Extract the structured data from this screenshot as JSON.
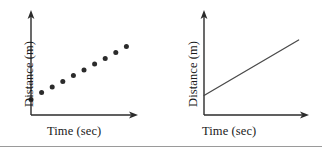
{
  "figure": {
    "background_color": "#ffffff",
    "ink_color": "#2b2b2b",
    "rule_color": "#9a9a9a"
  },
  "panels": [
    {
      "id": "left",
      "name": "scatter-plot-panel",
      "xlabel": "Time (sec)",
      "ylabel": "Distance (m)",
      "axis": {
        "origin_x": 31,
        "origin_y": 115,
        "y_top": 12,
        "x_right": 137,
        "arrowheads": [
          "y-top",
          "x-right"
        ]
      }
    },
    {
      "id": "right",
      "name": "line-plot-panel",
      "xlabel": "Time (sec)",
      "ylabel": "Distance (m)",
      "axis": {
        "origin_x": 43,
        "origin_y": 115,
        "y_top": 12,
        "x_right": 147,
        "arrowheads": [
          "y-top",
          "x-right"
        ]
      }
    }
  ],
  "chart_data": [
    {
      "type": "scatter",
      "title": "",
      "xlabel": "Time (sec)",
      "ylabel": "Distance (m)",
      "xlim": [
        0,
        10
      ],
      "ylim": [
        0,
        10
      ],
      "grid": false,
      "legend": "none",
      "marker": {
        "shape": "circle",
        "color": "#2b2b2b",
        "size_px": 5
      },
      "x": [
        0,
        1,
        2,
        3,
        4,
        5,
        6,
        7,
        8,
        9
      ],
      "y": [
        1.55,
        2.25,
        2.8,
        3.35,
        3.95,
        4.5,
        5.1,
        5.65,
        6.25,
        6.85
      ],
      "annotations": [
        "Distance increases steadily with time"
      ]
    },
    {
      "type": "line",
      "title": "",
      "xlabel": "Time (sec)",
      "ylabel": "Distance (m)",
      "xlim": [
        0,
        10
      ],
      "ylim": [
        0,
        10
      ],
      "grid": false,
      "legend": "none",
      "line": {
        "color": "#4a4a4a",
        "width_px": 1.3
      },
      "x": [
        0,
        9.1
      ],
      "y": [
        1.95,
        7.5
      ],
      "annotations": [
        "Constant positive slope straight line"
      ]
    }
  ]
}
